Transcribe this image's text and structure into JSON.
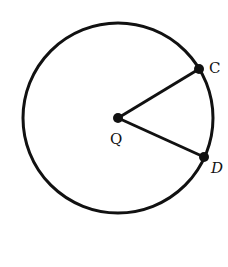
{
  "diagram": {
    "type": "circle-sector",
    "center": {
      "label": "Q",
      "x": 118,
      "y": 118
    },
    "radius": 95,
    "points": [
      {
        "label": "C",
        "x": 199,
        "y": 69
      },
      {
        "label": "D",
        "x": 204,
        "y": 157
      }
    ],
    "segments": [
      [
        "Q",
        "C"
      ],
      [
        "Q",
        "D"
      ]
    ],
    "stroke_color": "#111111"
  }
}
